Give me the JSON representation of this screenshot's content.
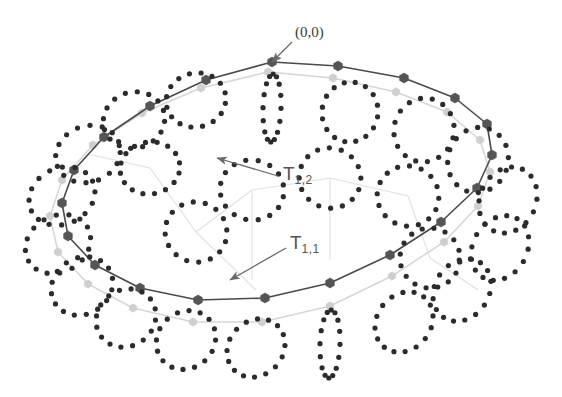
{
  "figure": {
    "name": "nested-torus-lattice-diagram",
    "background": "#ffffff",
    "width": 562,
    "height": 397,
    "annotations": [
      {
        "id": "origin",
        "text": "(0,0)",
        "x": 295,
        "y": 24,
        "arrow": {
          "x1": 292,
          "y1": 42,
          "x2": 272,
          "y2": 62
        }
      },
      {
        "id": "t12",
        "base": "T",
        "sub": "1,2",
        "x": 283,
        "y": 163,
        "arrow": {
          "x1": 278,
          "y1": 176,
          "x2": 217,
          "y2": 158
        }
      },
      {
        "id": "t11",
        "base": "T",
        "sub": "1,1",
        "x": 290,
        "y": 232,
        "arrow": {
          "x1": 286,
          "y1": 248,
          "x2": 230,
          "y2": 280
        }
      }
    ],
    "colors": {
      "outer_ring_line": "#4a4a4a",
      "outer_ring_vertex": "#555555",
      "inner_ring_line": "#d8d8d8",
      "inner_ring_vertex": "#cfcfcf",
      "dot": "#2b2b2b",
      "label_text": "#555555",
      "arrow": "#6a6a6a"
    }
  },
  "chart_data": {
    "type": "scatter",
    "title": "",
    "xlabel": "",
    "ylabel": "",
    "grid": false,
    "legend": "none",
    "series": [
      {
        "name": "T_1,1",
        "kind": "closed-polygon",
        "stroke": "#4a4a4a",
        "stroke_width": 1.6,
        "vertex_marker": "hexagon",
        "vertex_fill": "#555555",
        "vertex_size": 5.0,
        "points": [
          [
            272,
            62
          ],
          [
            338,
            66
          ],
          [
            404,
            78
          ],
          [
            455,
            98
          ],
          [
            487,
            124
          ],
          [
            492,
            155
          ],
          [
            477,
            188
          ],
          [
            441,
            222
          ],
          [
            390,
            255
          ],
          [
            330,
            283
          ],
          [
            265,
            298
          ],
          [
            198,
            300
          ],
          [
            140,
            288
          ],
          [
            95,
            265
          ],
          [
            68,
            236
          ],
          [
            62,
            203
          ],
          [
            74,
            170
          ],
          [
            104,
            137
          ],
          [
            150,
            106
          ],
          [
            206,
            80
          ]
        ]
      },
      {
        "name": "T_1,2",
        "kind": "closed-polygon",
        "stroke": "#d6d6d6",
        "stroke_width": 1.5,
        "vertex_marker": "hexagon",
        "vertex_fill": "#cfcfcf",
        "vertex_size": 4.2,
        "points": [
          [
            268,
            72
          ],
          [
            333,
            78
          ],
          [
            396,
            92
          ],
          [
            447,
            112
          ],
          [
            480,
            140
          ],
          [
            490,
            172
          ],
          [
            478,
            206
          ],
          [
            444,
            242
          ],
          [
            392,
            276
          ],
          [
            330,
            306
          ],
          [
            262,
            322
          ],
          [
            193,
            322
          ],
          [
            133,
            308
          ],
          [
            88,
            284
          ],
          [
            58,
            252
          ],
          [
            50,
            216
          ],
          [
            62,
            180
          ],
          [
            93,
            145
          ],
          [
            142,
            113
          ],
          [
            201,
            88
          ]
        ]
      },
      {
        "name": "vertex-dot-clusters",
        "kind": "dot-rings",
        "dot_color": "#2b2b2b",
        "dot_radius": 2.6,
        "dots_per_ring": 16,
        "rings": [
          {
            "cx": 272,
            "cy": 108,
            "rx": 9,
            "ry": 34,
            "rot": 2
          },
          {
            "cx": 350,
            "cy": 112,
            "rx": 28,
            "ry": 30,
            "rot": 10
          },
          {
            "cx": 424,
            "cy": 130,
            "rx": 30,
            "ry": 32,
            "rot": 15
          },
          {
            "cx": 478,
            "cy": 160,
            "rx": 30,
            "ry": 33,
            "rot": 20
          },
          {
            "cx": 508,
            "cy": 200,
            "rx": 28,
            "ry": 34,
            "rot": 25
          },
          {
            "cx": 500,
            "cy": 248,
            "rx": 27,
            "ry": 34,
            "rot": 30
          },
          {
            "cx": 462,
            "cy": 290,
            "rx": 27,
            "ry": 33,
            "rot": 34
          },
          {
            "cx": 404,
            "cy": 322,
            "rx": 27,
            "ry": 32,
            "rot": 38
          },
          {
            "cx": 330,
            "cy": 344,
            "rx": 10,
            "ry": 34,
            "rot": 2
          },
          {
            "cx": 256,
            "cy": 348,
            "rx": 27,
            "ry": 31,
            "rot": 44
          },
          {
            "cx": 186,
            "cy": 340,
            "rx": 28,
            "ry": 31,
            "rot": 48
          },
          {
            "cx": 126,
            "cy": 318,
            "rx": 28,
            "ry": 31,
            "rot": 52
          },
          {
            "cx": 82,
            "cy": 286,
            "rx": 28,
            "ry": 32,
            "rot": 56
          },
          {
            "cx": 58,
            "cy": 244,
            "rx": 28,
            "ry": 34,
            "rot": 60
          },
          {
            "cx": 62,
            "cy": 196,
            "rx": 28,
            "ry": 34,
            "rot": 64
          },
          {
            "cx": 88,
            "cy": 154,
            "rx": 28,
            "ry": 33,
            "rot": 68
          },
          {
            "cx": 134,
            "cy": 120,
            "rx": 28,
            "ry": 31,
            "rot": 72
          },
          {
            "cx": 196,
            "cy": 100,
            "rx": 27,
            "ry": 30,
            "rot": 76
          },
          {
            "cx": 252,
            "cy": 190,
            "rx": 32,
            "ry": 30,
            "rot": 12
          },
          {
            "cx": 196,
            "cy": 232,
            "rx": 31,
            "ry": 30,
            "rot": 18
          },
          {
            "cx": 330,
            "cy": 178,
            "rx": 31,
            "ry": 30,
            "rot": 22
          },
          {
            "cx": 408,
            "cy": 196,
            "rx": 31,
            "ry": 30,
            "rot": 26
          },
          {
            "cx": 430,
            "cy": 258,
            "rx": 30,
            "ry": 30,
            "rot": 30
          },
          {
            "cx": 150,
            "cy": 168,
            "rx": 26,
            "ry": 30,
            "rot": 80
          }
        ]
      },
      {
        "name": "radial-spokes",
        "kind": "light-connectors",
        "stroke": "#e0e0e0",
        "stroke_width": 1.1,
        "segments": [
          [
            [
              150,
              168
            ],
            [
              196,
              232
            ]
          ],
          [
            [
              196,
              232
            ],
            [
              252,
              190
            ]
          ],
          [
            [
              252,
              190
            ],
            [
              330,
              178
            ]
          ],
          [
            [
              330,
              178
            ],
            [
              408,
              196
            ]
          ],
          [
            [
              408,
              196
            ],
            [
              430,
              258
            ]
          ],
          [
            [
              196,
              232
            ],
            [
              256,
              290
            ]
          ],
          [
            [
              252,
              190
            ],
            [
              252,
              280
            ]
          ],
          [
            [
              330,
              178
            ],
            [
              330,
              260
            ]
          ],
          [
            [
              88,
              154
            ],
            [
              150,
              168
            ]
          ],
          [
            [
              430,
              258
            ],
            [
              478,
              290
            ]
          ]
        ]
      }
    ]
  }
}
